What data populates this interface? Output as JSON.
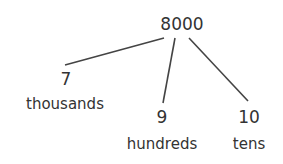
{
  "diagram": {
    "type": "number-bond-tree",
    "root": {
      "value": "8000"
    },
    "children": [
      {
        "value": "7",
        "label": "thousands"
      },
      {
        "value": "9",
        "label": "hundreds"
      },
      {
        "value": "10",
        "label": "tens"
      }
    ],
    "colors": {
      "text": "#333333",
      "line": "#444444",
      "background": "#ffffff"
    }
  }
}
